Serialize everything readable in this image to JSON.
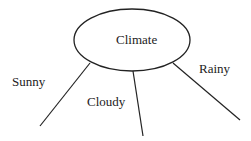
{
  "diagram": {
    "root": {
      "label": "Climate"
    },
    "branches": [
      {
        "label": "Sunny"
      },
      {
        "label": "Cloudy"
      },
      {
        "label": "Rainy"
      }
    ],
    "colors": {
      "stroke": "#222222",
      "text": "#222222",
      "background": "#ffffff"
    }
  }
}
